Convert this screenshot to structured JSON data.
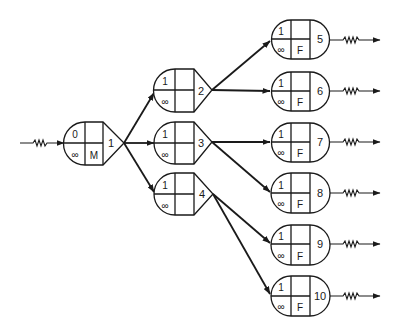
{
  "diagram": {
    "title": "",
    "nodes": [
      {
        "id": "1",
        "top": "0",
        "bottom_left": "∞",
        "bottom_right": "M",
        "shape": "arrow"
      },
      {
        "id": "2",
        "top": "1",
        "bottom_left": "∞",
        "bottom_right": "",
        "shape": "arrow"
      },
      {
        "id": "3",
        "top": "1",
        "bottom_left": "∞",
        "bottom_right": "",
        "shape": "arrow"
      },
      {
        "id": "4",
        "top": "1",
        "bottom_left": "∞",
        "bottom_right": "",
        "shape": "arrow"
      },
      {
        "id": "5",
        "top": "1",
        "bottom_left": "∞",
        "bottom_right": "F",
        "shape": "rounded"
      },
      {
        "id": "6",
        "top": "1",
        "bottom_left": "∞",
        "bottom_right": "F",
        "shape": "rounded"
      },
      {
        "id": "7",
        "top": "1",
        "bottom_left": "∞",
        "bottom_right": "F",
        "shape": "rounded"
      },
      {
        "id": "8",
        "top": "1",
        "bottom_left": "∞",
        "bottom_right": "F",
        "shape": "rounded"
      },
      {
        "id": "9",
        "top": "1",
        "bottom_left": "∞",
        "bottom_right": "F",
        "shape": "rounded"
      },
      {
        "id": "10",
        "top": "1",
        "bottom_left": "∞",
        "bottom_right": "F",
        "shape": "rounded"
      }
    ],
    "edges": [
      {
        "from": "input",
        "to": "1",
        "style": "zigzag-arrow"
      },
      {
        "from": "1",
        "to": "2"
      },
      {
        "from": "1",
        "to": "3"
      },
      {
        "from": "1",
        "to": "4"
      },
      {
        "from": "2",
        "to": "5"
      },
      {
        "from": "2",
        "to": "6"
      },
      {
        "from": "3",
        "to": "7"
      },
      {
        "from": "3",
        "to": "8"
      },
      {
        "from": "4",
        "to": "9"
      },
      {
        "from": "4",
        "to": "10"
      },
      {
        "from": "5",
        "to": "output",
        "style": "zigzag-arrow"
      },
      {
        "from": "6",
        "to": "output",
        "style": "zigzag-arrow"
      },
      {
        "from": "7",
        "to": "output",
        "style": "zigzag-arrow"
      },
      {
        "from": "8",
        "to": "output",
        "style": "zigzag-arrow"
      },
      {
        "from": "9",
        "to": "output",
        "style": "zigzag-arrow"
      },
      {
        "from": "10",
        "to": "output",
        "style": "zigzag-arrow"
      }
    ],
    "colors": {
      "stroke": "#1a1a1a",
      "background": "#ffffff"
    }
  }
}
